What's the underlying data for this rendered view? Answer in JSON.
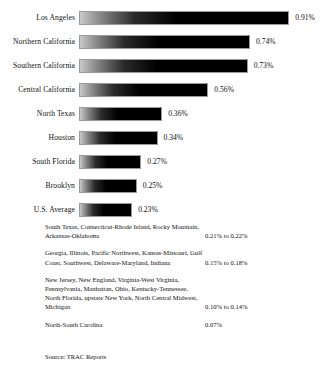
{
  "chart_data": {
    "type": "bar",
    "orientation": "horizontal",
    "title": "",
    "xlabel": "",
    "ylabel": "",
    "xlim": [
      0,
      0.91
    ],
    "grid": false,
    "legend": null,
    "categories": [
      "Los Angeles",
      "Northern California",
      "Southern California",
      "Central California",
      "North Texas",
      "Houston",
      "South Florida",
      "Brooklyn",
      "U.S. Average"
    ],
    "values": [
      0.91,
      0.74,
      0.73,
      0.56,
      0.36,
      0.34,
      0.27,
      0.25,
      0.23
    ],
    "value_labels": [
      "0.91%",
      "0.74%",
      "0.73%",
      "0.56%",
      "0.36%",
      "0.34%",
      "0.27%",
      "0.25%",
      "0.23%"
    ],
    "unit": "%",
    "annotations": [
      {
        "regions": "South Texas, Connecticut-Rhode Island, Rocky Mountain, Arkansas-Oklahoma",
        "value": "0.21% to 0.22%"
      },
      {
        "regions": "Georgia, Illinois, Pacific Northwest, Kansas-Missouri, Gulf Coast, Southwest, Delaware-Maryland, Indiana",
        "value": "0.15% to 0.18%"
      },
      {
        "regions": "New Jersey, New England, Virginia-West Virginia, Pennsylvania, Manhattan, Ohio, Kentucky-Tennessee, North Florida, upstate New York, North Central Midwest, Michigan",
        "value": "0.10% to 0.14%"
      },
      {
        "regions": "North-South Carolina",
        "value": "0.07%"
      }
    ],
    "source": "Source: TRAC Reports"
  },
  "style": {
    "bar_dark": "#000000",
    "bar_light": "#c9c9c9",
    "bar_border": "#9a9a9a",
    "text_color": "#111111",
    "background": "#ffffff"
  }
}
